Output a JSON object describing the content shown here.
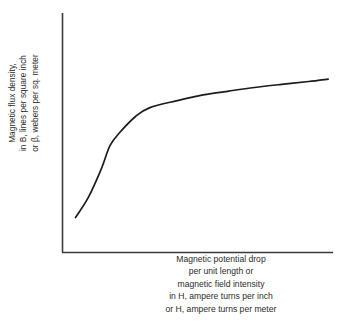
{
  "chart_data": {
    "type": "line",
    "title": "",
    "subtitle": "",
    "ylabel_lines": [
      "Magnetic flux density,",
      "in B, lines per square inch",
      "or β, webers per sq. meter"
    ],
    "xlabel_lines": [
      "Magnetic potential drop",
      "per unit length or",
      "magnetic field intensity",
      "in H, ampere turns per inch",
      "or H, ampere turns per meter"
    ],
    "xlabel": "Magnetic potential drop per unit length or magnetic field intensity in H, ampere turns per inch or H, ampere turns per meter",
    "ylabel": "Magnetic flux density, in B, lines per square inch or β, webers per sq. meter",
    "grid": false,
    "legend": "none",
    "tick_labels_x": [],
    "tick_labels_y": [],
    "xlim": [
      0,
      100
    ],
    "ylim": [
      0,
      100
    ],
    "series": [
      {
        "name": "magnetization-curve",
        "description": "B-H saturation curve",
        "color": "#1c1c1c",
        "x": [
          4.8,
          9.5,
          14.2,
          17.6,
          21.4,
          27.1,
          32.3,
          42.4,
          52.0,
          61.5,
          71.0,
          81.0,
          91.0,
          98.2
        ],
        "y": [
          14.6,
          22.9,
          34.5,
          44.7,
          50.4,
          56.9,
          60.5,
          63.4,
          65.8,
          67.4,
          68.9,
          70.2,
          71.4,
          72.4
        ]
      }
    ],
    "axis_color": "#3a3a3a",
    "background": "#ffffff"
  }
}
